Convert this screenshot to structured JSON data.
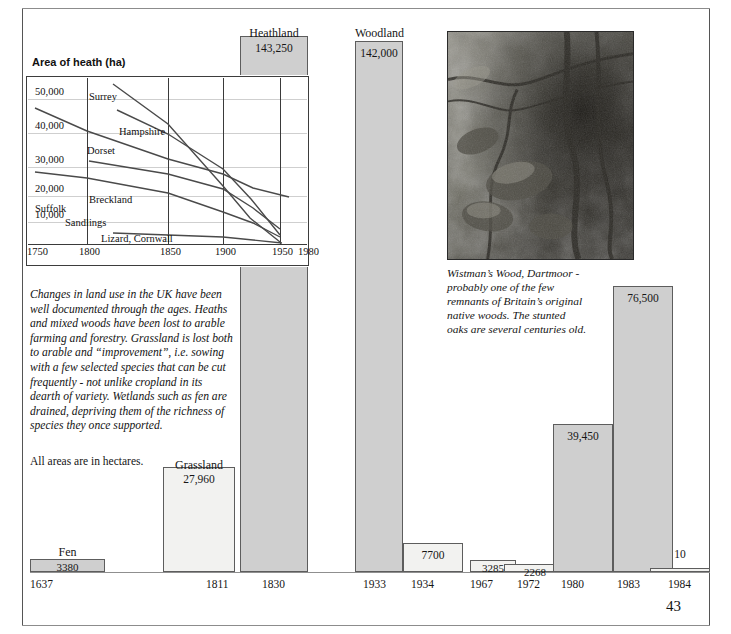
{
  "page": {
    "number": "43",
    "scan_artifact_top": "",
    "hectares_note": "All areas are in hectares."
  },
  "line_chart": {
    "title": "Area of heath (ha)",
    "y_ticks": [
      "50,000",
      "40,000",
      "30,000",
      "20,000",
      "10,000"
    ],
    "x_ticks": [
      "1750",
      "1800",
      "1850",
      "1900",
      "1950",
      "1980"
    ],
    "series_labels": [
      "Surrey",
      "Hampshire",
      "Dorset",
      "Breckland",
      "Suffolk",
      "Sandlings",
      "Lizard,  Cornwall"
    ]
  },
  "body_text": "Changes in land use in the UK have been well documented through the ages. Heaths and mixed woods have been lost to arable farming and forestry. Grassland is lost both to arable and “improvement”, i.e. sowing with a few selected species that can be cut frequently - not unlike cropland in its dearth of variety. Wetlands such as fen are drained, depriving them of the richness of species they once supported.",
  "photo": {
    "alt_name": "wistmans-wood-photograph",
    "caption": "Wistman’s Wood, Dartmoor - probably one of the few remnants of Britain’s original native woods. The stunted oaks are several centuries old."
  },
  "chart_data": {
    "type": "bar",
    "xlabel": "",
    "ylabel": "Area (ha)",
    "ylim": [
      0,
      143250
    ],
    "categories": [
      "1637",
      "1811",
      "1830",
      "1933",
      "1934",
      "1967",
      "1972",
      "1980",
      "1983",
      "1984"
    ],
    "values": [
      3380,
      27960,
      143250,
      142000,
      7700,
      3285,
      2268,
      39450,
      76500,
      10
    ],
    "value_labels": [
      "3380",
      "27,960",
      "143,250",
      "142,000",
      "7700",
      "3285",
      "2268",
      "39,450",
      "76,500",
      "10"
    ],
    "bar_names": [
      "Fen",
      "Grassland",
      "Heathland",
      "Woodland",
      "",
      "",
      "",
      "",
      "",
      ""
    ],
    "grid": false,
    "legend": "none"
  }
}
